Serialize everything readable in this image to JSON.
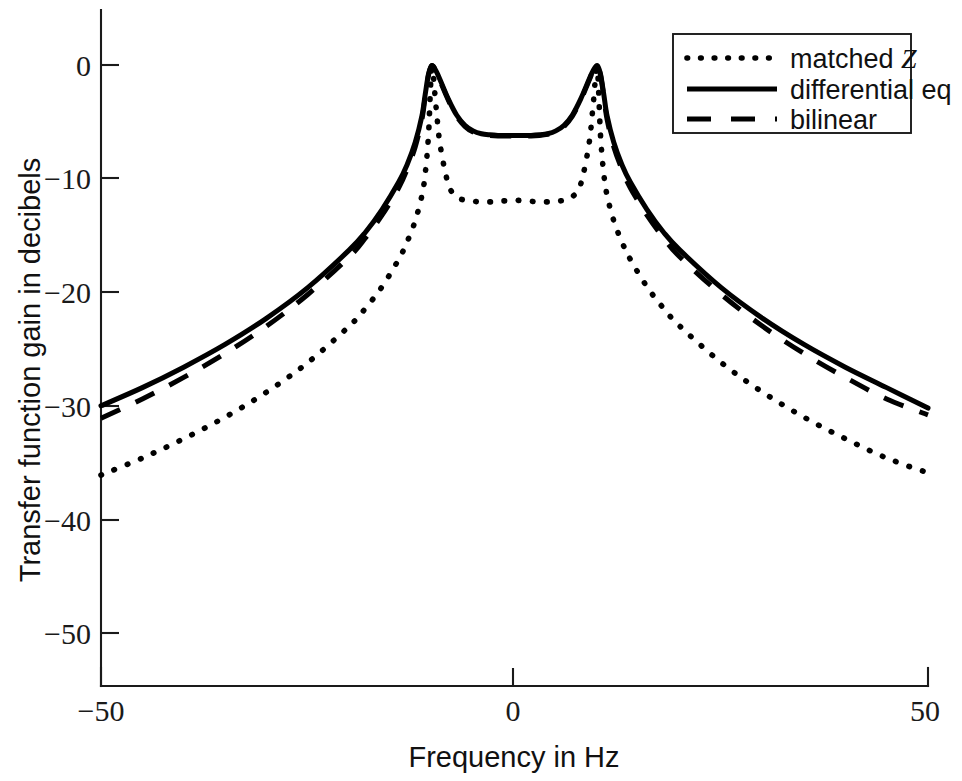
{
  "chart_data": {
    "type": "line",
    "title": "",
    "xlabel": "Frequency in Hz",
    "ylabel": "Transfer function gain in decibels",
    "xlim": [
      -50,
      50
    ],
    "ylim": [
      -55,
      2
    ],
    "xticks": [
      -50,
      0,
      50
    ],
    "xticklabels": [
      "−50",
      "0",
      "50"
    ],
    "yticks": [
      0,
      -10,
      -20,
      -30,
      -40,
      -50
    ],
    "yticklabels": [
      "0",
      "−10",
      "−20",
      "−30",
      "−40",
      "−50"
    ],
    "grid": false,
    "legend_position": "upper right",
    "series": [
      {
        "name": "matched Z",
        "style": "dotted",
        "color": "#000000",
        "x": [
          -50,
          -45,
          -40,
          -35,
          -30,
          -25,
          -20,
          -18,
          -16,
          -14,
          -13,
          -12,
          -11.2,
          -10.8,
          -10.4,
          -10,
          -9.5,
          -9,
          -8,
          -7,
          -6,
          -5,
          -4,
          -3,
          -2,
          -1,
          0,
          1,
          2,
          3,
          4,
          5,
          6,
          7,
          8,
          9,
          9.5,
          10,
          10.4,
          10.8,
          11.2,
          12,
          13,
          14,
          16,
          18,
          20,
          25,
          30,
          35,
          40,
          45,
          50
        ],
        "y": [
          -36.1,
          -34.6,
          -32.9,
          -31.0,
          -28.8,
          -26.2,
          -23.0,
          -21.4,
          -19.5,
          -17.1,
          -15.6,
          -13.7,
          -11.5,
          -9.6,
          -6.2,
          -0.3,
          -3.6,
          -7.0,
          -10.5,
          -11.6,
          -11.9,
          -12.0,
          -12.05,
          -12.05,
          -12.0,
          -11.95,
          -11.9,
          -11.95,
          -12.0,
          -12.05,
          -12.05,
          -12.0,
          -11.9,
          -11.6,
          -10.5,
          -7.0,
          -3.6,
          -0.3,
          -6.2,
          -9.6,
          -11.5,
          -13.7,
          -15.6,
          -17.1,
          -19.5,
          -21.4,
          -23.0,
          -26.2,
          -28.8,
          -31.0,
          -32.9,
          -34.6,
          -35.9
        ]
      },
      {
        "name": "differential eq",
        "style": "solid",
        "color": "#000000",
        "x": [
          -50,
          -45,
          -40,
          -35,
          -30,
          -25,
          -20,
          -18,
          -16,
          -14,
          -13,
          -12,
          -11.2,
          -10.8,
          -10.4,
          -10,
          -9.5,
          -9,
          -8,
          -7,
          -6,
          -5,
          -4,
          -3,
          -2,
          -1,
          0,
          1,
          2,
          3,
          4,
          5,
          6,
          7,
          8,
          9,
          9.5,
          10,
          10.4,
          10.8,
          11.2,
          12,
          13,
          14,
          16,
          18,
          20,
          25,
          30,
          35,
          40,
          45,
          50
        ],
        "y": [
          -30.0,
          -28.4,
          -26.6,
          -24.6,
          -22.3,
          -19.6,
          -16.3,
          -14.7,
          -12.7,
          -10.3,
          -8.8,
          -6.8,
          -4.5,
          -2.6,
          -0.8,
          -0.05,
          -0.5,
          -1.3,
          -3.0,
          -4.4,
          -5.3,
          -5.8,
          -6.05,
          -6.15,
          -6.2,
          -6.2,
          -6.2,
          -6.2,
          -6.2,
          -6.15,
          -6.05,
          -5.8,
          -5.3,
          -4.4,
          -3.0,
          -1.3,
          -0.5,
          -0.05,
          -0.8,
          -2.6,
          -4.5,
          -6.8,
          -8.8,
          -10.3,
          -12.7,
          -14.7,
          -16.3,
          -19.6,
          -22.3,
          -24.6,
          -26.6,
          -28.4,
          -30.2
        ]
      },
      {
        "name": "bilinear",
        "style": "dashed",
        "color": "#000000",
        "x": [
          -50,
          -45,
          -40,
          -35,
          -30,
          -25,
          -20,
          -18,
          -16,
          -14,
          -13,
          -12,
          -11.2,
          -10.8,
          -10.4,
          -10,
          -9.5,
          -9,
          -8,
          -7,
          -6,
          -5,
          -4,
          -3,
          -2,
          -1,
          0,
          1,
          2,
          3,
          4,
          5,
          6,
          7,
          8,
          9,
          9.5,
          10,
          10.4,
          10.8,
          11.2,
          12,
          13,
          14,
          16,
          18,
          20,
          25,
          30,
          35,
          40,
          45,
          50
        ],
        "y": [
          -31.1,
          -29.4,
          -27.5,
          -25.4,
          -23.0,
          -20.2,
          -16.9,
          -15.2,
          -13.2,
          -10.8,
          -9.2,
          -7.2,
          -4.8,
          -2.8,
          -0.9,
          -0.05,
          -0.5,
          -1.4,
          -3.1,
          -4.5,
          -5.4,
          -5.9,
          -6.1,
          -6.2,
          -6.25,
          -6.25,
          -6.25,
          -6.25,
          -6.25,
          -6.2,
          -6.1,
          -5.9,
          -5.4,
          -4.5,
          -3.1,
          -1.4,
          -0.5,
          -0.05,
          -0.9,
          -2.8,
          -4.8,
          -7.2,
          -9.2,
          -10.8,
          -13.2,
          -15.2,
          -16.9,
          -20.2,
          -23.0,
          -25.4,
          -27.5,
          -29.4,
          -30.8
        ]
      }
    ],
    "peaks": [
      {
        "x": -10.6,
        "y": 0
      },
      {
        "x": 11.0,
        "y": 0
      }
    ],
    "center_dip": {
      "x": 0,
      "solid_y": -6.2,
      "dotted_y": -11.9
    }
  },
  "legend": {
    "entries": [
      {
        "label_prefix": "matched ",
        "label_italic": "Z",
        "style": "dotted"
      },
      {
        "label_prefix": "differential eq",
        "label_italic": "",
        "style": "solid"
      },
      {
        "label_prefix": "bilinear",
        "label_italic": "",
        "style": "dashed"
      }
    ]
  },
  "axes": {
    "x_title": "Frequency in Hz",
    "y_title": "Transfer function gain in decibels",
    "x_tick_0": "−50",
    "x_tick_1": "0",
    "x_tick_2": "50",
    "y_tick_0": "0",
    "y_tick_1": "−10",
    "y_tick_2": "−20",
    "y_tick_3": "−30",
    "y_tick_4": "−40",
    "y_tick_5": "−50"
  },
  "style": {
    "axis_color": "#1a1a1a",
    "curve_color": "#000000",
    "background": "#ffffff"
  }
}
